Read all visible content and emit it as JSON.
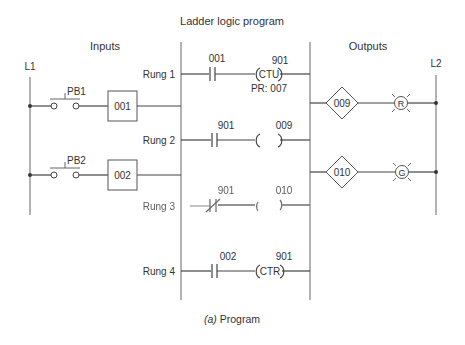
{
  "title": "Ladder logic program",
  "caption_prefix": "(a)",
  "caption_text": " Program",
  "sections": {
    "inputs": "Inputs",
    "outputs": "Outputs"
  },
  "rails": {
    "left": "L1",
    "right": "L2"
  },
  "inputs": [
    {
      "switch_label": "PB1",
      "module": "001"
    },
    {
      "switch_label": "PB2",
      "module": "002"
    }
  ],
  "rungs": [
    {
      "label": "Rung 1",
      "contact_addr": "001",
      "contact_type": "NO",
      "coil_addr": "901",
      "coil_text": "CTU",
      "preset": "PR: 007"
    },
    {
      "label": "Rung 2",
      "contact_addr": "901",
      "contact_type": "NO",
      "coil_addr": "009",
      "coil_text": ""
    },
    {
      "label": "Rung 3",
      "contact_addr": "901",
      "contact_type": "NC",
      "coil_addr": "010",
      "coil_text": ""
    },
    {
      "label": "Rung 4",
      "contact_addr": "002",
      "contact_type": "NO",
      "coil_addr": "901",
      "coil_text": "CTR"
    }
  ],
  "outputs": [
    {
      "module": "009",
      "lamp": "R"
    },
    {
      "module": "010",
      "lamp": "G"
    }
  ]
}
